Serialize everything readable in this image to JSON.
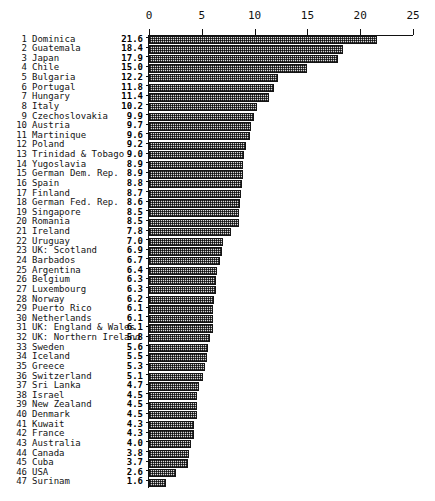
{
  "chart_data": {
    "type": "bar",
    "orientation": "horizontal",
    "title": "",
    "subtitle": "",
    "xlabel": "",
    "ylabel": "",
    "xlim": [
      0,
      25
    ],
    "ylim": [
      0,
      48
    ],
    "grid": false,
    "legend": null,
    "axis": {
      "tick_values": [
        0,
        5,
        10,
        15,
        20,
        25
      ],
      "tick_labels": [
        "0",
        "5",
        "10",
        "15",
        "20",
        "25"
      ],
      "position": "top"
    },
    "bar_style": {
      "fill": "hatched-dither-gray",
      "edge_color": "#151515"
    },
    "categories": [
      "Dominica",
      "Guatemala",
      "Japan",
      "Chile",
      "Bulgaria",
      "Portugal",
      "Hungary",
      "Italy",
      "Czechoslovakia",
      "Austria",
      "Martinique",
      "Poland",
      "Trinidad & Tobago",
      "Yugoslavia",
      "German Dem. Rep.",
      "Spain",
      "Finland",
      "German Fed. Rep.",
      "Singapore",
      "Romania",
      "Ireland",
      "Uruguay",
      "UK: Scotland",
      "Barbados",
      "Argentina",
      "Belgium",
      "Luxembourg",
      "Norway",
      "Puerto Rico",
      "Netherlands",
      "UK: England & Wales",
      "UK: Northern Ireland",
      "Sweden",
      "Iceland",
      "Greece",
      "Switzerland",
      "Sri Lanka",
      "Israel",
      "New Zealand",
      "Denmark",
      "Kuwait",
      "France",
      "Australia",
      "Canada",
      "Cuba",
      "USA",
      "Surinam"
    ],
    "values": [
      21.6,
      18.4,
      17.9,
      15.0,
      12.2,
      11.8,
      11.4,
      10.2,
      9.9,
      9.7,
      9.6,
      9.2,
      9.0,
      8.9,
      8.9,
      8.8,
      8.7,
      8.6,
      8.5,
      8.5,
      7.8,
      7.0,
      6.9,
      6.7,
      6.4,
      6.3,
      6.3,
      6.2,
      6.1,
      6.1,
      6.1,
      5.8,
      5.6,
      5.5,
      5.3,
      5.1,
      4.7,
      4.5,
      4.5,
      4.5,
      4.3,
      4.3,
      4.0,
      3.8,
      3.7,
      2.6,
      1.6
    ],
    "ranks": [
      "1",
      "2",
      "3",
      "4",
      "5",
      "6",
      "7",
      "8",
      "9",
      "10",
      "11",
      "12",
      "13",
      "14",
      "15",
      "16",
      "17",
      "18",
      "19",
      "20",
      "21",
      "22",
      "23",
      "24",
      "25",
      "26",
      "27",
      "28",
      "29",
      "30",
      "31",
      "32",
      "33",
      "34",
      "35",
      "36",
      "37",
      "38",
      "39",
      "40",
      "41",
      "42",
      "43",
      "44",
      "45",
      "46",
      "47"
    ],
    "value_labels": [
      "21.6",
      "18.4",
      "17.9",
      "15.0",
      "12.2",
      "11.8",
      "11.4",
      "10.2",
      "9.9",
      "9.7",
      "9.6",
      "9.2",
      "9.0",
      "8.9",
      "8.9",
      "8.8",
      "8.7",
      "8.6",
      "8.5",
      "8.5",
      "7.8",
      "7.0",
      "6.9",
      "6.7",
      "6.4",
      "6.3",
      "6.3",
      "6.2",
      "6.1",
      "6.1",
      "6.1",
      "5.8",
      "5.6",
      "5.5",
      "5.3",
      "5.1",
      "4.7",
      "4.5",
      "4.5",
      "4.5",
      "4.3",
      "4.3",
      "4.0",
      "3.8",
      "3.7",
      "2.6",
      "1.6"
    ]
  },
  "layout": {
    "axis_left_px": 149,
    "axis_width_px": 264,
    "row_pitch_px": 9.63,
    "rows_top_px": 35
  }
}
